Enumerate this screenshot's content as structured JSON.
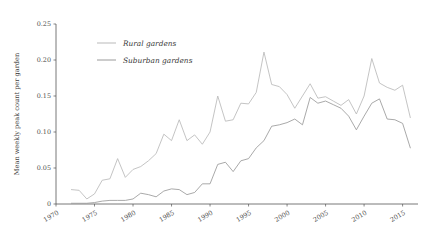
{
  "chart_data": {
    "type": "line",
    "title": "",
    "xlabel": "",
    "ylabel": "Mean weekly peak count per garden",
    "xlim": [
      1970,
      2017
    ],
    "ylim": [
      0,
      0.25
    ],
    "grid": false,
    "legend_position": "upper-left-inside",
    "xticks": [
      1970,
      1975,
      1980,
      1985,
      1990,
      1995,
      2000,
      2005,
      2010,
      2015
    ],
    "xtick_labels": [
      "1970",
      "1975",
      "1980",
      "1985",
      "1990",
      "1995",
      "2000",
      "2005",
      "2010",
      "2015"
    ],
    "yticks": [
      0,
      0.05,
      0.1,
      0.15,
      0.2,
      0.25
    ],
    "ytick_labels": [
      "0",
      "0.05",
      "0.10",
      "0.15",
      "0.20",
      "0.25"
    ],
    "x": [
      1972,
      1973,
      1974,
      1975,
      1976,
      1977,
      1978,
      1979,
      1980,
      1981,
      1982,
      1983,
      1984,
      1985,
      1986,
      1987,
      1988,
      1989,
      1990,
      1991,
      1992,
      1993,
      1994,
      1995,
      1996,
      1997,
      1998,
      1999,
      2000,
      2001,
      2002,
      2003,
      2004,
      2005,
      2006,
      2007,
      2008,
      2009,
      2010,
      2011,
      2012,
      2013,
      2014,
      2015,
      2016
    ],
    "series": [
      {
        "name": "Rural gardens",
        "color": "#b9b9b9",
        "values": [
          0.02,
          0.019,
          0.007,
          0.014,
          0.033,
          0.035,
          0.063,
          0.037,
          0.048,
          0.052,
          0.06,
          0.07,
          0.097,
          0.088,
          0.117,
          0.088,
          0.096,
          0.083,
          0.1,
          0.15,
          0.115,
          0.117,
          0.14,
          0.139,
          0.155,
          0.211,
          0.166,
          0.163,
          0.152,
          0.133,
          0.15,
          0.167,
          0.147,
          0.149,
          0.143,
          0.137,
          0.145,
          0.125,
          0.15,
          0.202,
          0.168,
          0.162,
          0.158,
          0.165,
          0.12
        ]
      },
      {
        "name": "Suburban gardens",
        "color": "#9a9a9a",
        "values": [
          0.001,
          0.001,
          0.001,
          0.002,
          0.004,
          0.005,
          0.005,
          0.005,
          0.007,
          0.015,
          0.013,
          0.01,
          0.018,
          0.021,
          0.02,
          0.013,
          0.016,
          0.028,
          0.028,
          0.055,
          0.058,
          0.045,
          0.06,
          0.063,
          0.078,
          0.088,
          0.108,
          0.11,
          0.113,
          0.118,
          0.11,
          0.148,
          0.14,
          0.143,
          0.138,
          0.133,
          0.122,
          0.103,
          0.122,
          0.14,
          0.146,
          0.118,
          0.117,
          0.112,
          0.078
        ]
      }
    ]
  },
  "legend": {
    "items": [
      {
        "label": "Rural gardens"
      },
      {
        "label": "Suburban gardens"
      }
    ]
  },
  "colors": {
    "rural": "#b9b9b9",
    "suburban": "#9a9a9a",
    "axis": "#555555",
    "text": "#3a3a3a",
    "background": "#ffffff"
  }
}
